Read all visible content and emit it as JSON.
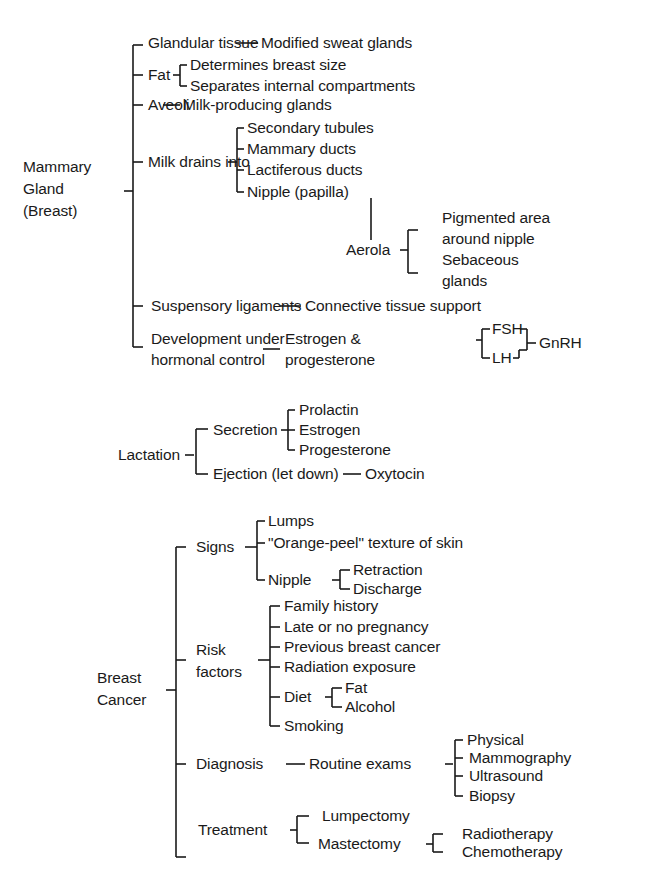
{
  "mammary": {
    "root": [
      "Mammary",
      "Gland",
      "(Breast)"
    ],
    "glandular": {
      "label": "Glandular tissue",
      "child": "Modified sweat glands"
    },
    "fat": {
      "label": "Fat",
      "children": [
        "Determines breast size",
        "Separates internal compartments"
      ]
    },
    "aveoli": {
      "label": "Aveoli",
      "child": "Milk-producing glands"
    },
    "milk": {
      "label": "Milk drains into",
      "children": [
        "Secondary tubules",
        "Mammary ducts",
        "Lactiferous ducts",
        "Nipple (papilla)"
      ]
    },
    "aerola": {
      "label": "Aerola",
      "children": [
        "Pigmented area",
        "around nipple",
        "Sebaceous",
        "glands"
      ]
    },
    "suspensory": {
      "label": "Suspensory ligaments",
      "child": "Connective tissue support"
    },
    "development": {
      "label": [
        "Development under",
        "hormonal control"
      ],
      "child": [
        "Estrogen &",
        "progesterone"
      ],
      "hormones": [
        "FSH",
        "LH"
      ],
      "releasing": "GnRH"
    }
  },
  "lactation": {
    "root": "Lactation",
    "secretion": {
      "label": "Secretion",
      "children": [
        "Prolactin",
        "Estrogen",
        "Progesterone"
      ]
    },
    "ejection": {
      "label": "Ejection (let down)",
      "child": "Oxytocin"
    }
  },
  "cancer": {
    "root": [
      "Breast",
      "Cancer"
    ],
    "signs": {
      "label": "Signs",
      "children": [
        "Lumps",
        "\"Orange-peel\"  texture of skin"
      ],
      "nipple": {
        "label": "Nipple",
        "children": [
          "Retraction",
          "Discharge"
        ]
      }
    },
    "risk": {
      "label": [
        "Risk",
        "factors"
      ],
      "children": [
        "Family history",
        "Late or no pregnancy",
        "Previous breast cancer",
        "Radiation exposure"
      ],
      "diet": {
        "label": "Diet",
        "children": [
          "Fat",
          "Alcohol"
        ]
      },
      "last": "Smoking"
    },
    "diagnosis": {
      "label": "Diagnosis",
      "child": "Routine exams",
      "exams": [
        "Physical",
        "Mammography",
        "Ultrasound",
        "Biopsy"
      ]
    },
    "treatment": {
      "label": "Treatment",
      "children": [
        "Lumpectomy",
        "Mastectomy"
      ],
      "mastectomy_followup": [
        "Radiotherapy",
        "Chemotherapy"
      ]
    }
  }
}
